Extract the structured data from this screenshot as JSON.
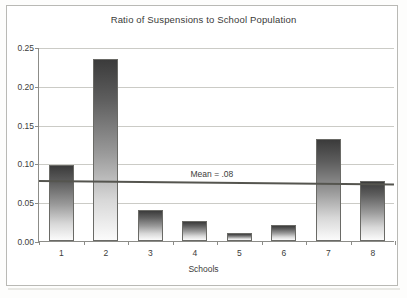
{
  "figure": {
    "title": "Ratio of Suspensions to School Population",
    "xaxis_title": "Schools",
    "mean_annotation": "Mean = .08"
  },
  "chart_data": {
    "type": "bar",
    "title": "Ratio of Suspensions to School Population",
    "xlabel": "Schools",
    "ylabel": "",
    "categories": [
      "1",
      "2",
      "3",
      "4",
      "5",
      "6",
      "7",
      "8"
    ],
    "values": [
      0.098,
      0.234,
      0.04,
      0.026,
      0.01,
      0.021,
      0.132,
      0.077
    ],
    "ylim": [
      0.0,
      0.25
    ],
    "ytick_labels": [
      "0.00",
      "0.05",
      "0.10",
      "0.15",
      "0.20",
      "0.25"
    ],
    "ytick_values": [
      0.0,
      0.05,
      0.1,
      0.15,
      0.2,
      0.25
    ],
    "grid": true,
    "legend": "none",
    "annotations": [
      {
        "type": "hline",
        "label": "Mean = .08",
        "value": 0.08
      }
    ],
    "series": [
      {
        "name": "Ratio of Suspensions to School Population",
        "values": [
          0.098,
          0.234,
          0.04,
          0.026,
          0.01,
          0.021,
          0.132,
          0.077
        ]
      }
    ]
  }
}
